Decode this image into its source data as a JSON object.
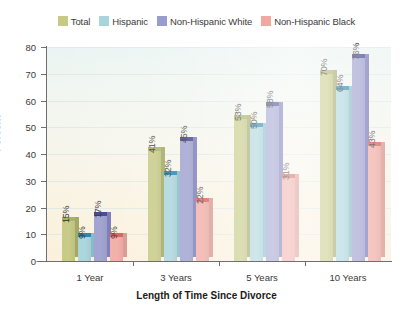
{
  "chart_data": {
    "type": "bar",
    "title": "",
    "subtitle": "",
    "xlabel": "Length of Time Since Divorce",
    "ylabel": "Percent",
    "categories": [
      "1 Year",
      "3 Years",
      "5 Years",
      "10 Years"
    ],
    "series": [
      {
        "name": "Total",
        "color": "#c6ca84",
        "top_color": "#a7ad63",
        "side_color": "#9fa55c",
        "values": [
          15,
          9,
          53,
          70
        ],
        "labels": [
          "15%",
          "41%",
          "53%",
          "70%"
        ]
      },
      {
        "name": "Hispanic",
        "color": "#a8d4dc",
        "top_color": "#1f7fa8",
        "side_color": "#7fb6c4",
        "values": [
          9,
          32,
          50,
          64
        ],
        "labels": [
          "9%",
          "32%",
          "50%",
          "64%"
        ]
      },
      {
        "name": "Non-Hispanic White",
        "color": "#9a9ccd",
        "top_color": "#393a86",
        "side_color": "#6f72b3",
        "values": [
          17,
          45,
          58,
          76
        ],
        "labels": [
          "17%",
          "45%",
          "58%",
          "76%"
        ]
      },
      {
        "name": "Non-Hispanic Black",
        "color": "#f0a8a0",
        "top_color": "#d9534a",
        "side_color": "#d88e86",
        "values": [
          9,
          22,
          31,
          43
        ],
        "labels": [
          "9%",
          "22%",
          "31%",
          "43%"
        ]
      }
    ],
    "series_values": [
      {
        "category": "1 Year",
        "Total": 15,
        "Hispanic": 9,
        "Non-Hispanic White": 17,
        "Non-Hispanic Black": 9
      },
      {
        "category": "3 Years",
        "Total": 41,
        "Hispanic": 32,
        "Non-Hispanic White": 45,
        "Non-Hispanic Black": 22
      },
      {
        "category": "5 Years",
        "Total": 53,
        "Hispanic": 50,
        "Non-Hispanic White": 58,
        "Non-Hispanic Black": 31
      },
      {
        "category": "10 Years",
        "Total": 70,
        "Hispanic": 64,
        "Non-Hispanic White": 76,
        "Non-Hispanic Black": 43
      }
    ],
    "ylim": [
      0,
      80
    ],
    "yticks": [
      0,
      10,
      20,
      30,
      40,
      50,
      60,
      70,
      80
    ],
    "ytick_labels": [
      "0",
      "10",
      "20",
      "30",
      "40",
      "50",
      "60",
      "70",
      "80"
    ],
    "grid": true,
    "legend_position": "top",
    "style": "3d-column",
    "value_labels_rotated": true
  },
  "legend": {
    "items": [
      {
        "label": "Total",
        "color": "#c6ca84"
      },
      {
        "label": "Hispanic",
        "color": "#a8d4dc"
      },
      {
        "label": "Non-Hispanic White",
        "color": "#9a9ccd"
      },
      {
        "label": "Non-Hispanic Black",
        "color": "#f0a8a0"
      }
    ]
  },
  "axes": {
    "y_title": "Percent",
    "x_title": "Length of Time Since Divorce",
    "y_tick_labels": [
      "80",
      "70",
      "60",
      "50",
      "40",
      "30",
      "20",
      "10",
      "0"
    ],
    "x_tick_labels": [
      "1 Year",
      "3 Years",
      "5 Years",
      "10 Years"
    ]
  }
}
